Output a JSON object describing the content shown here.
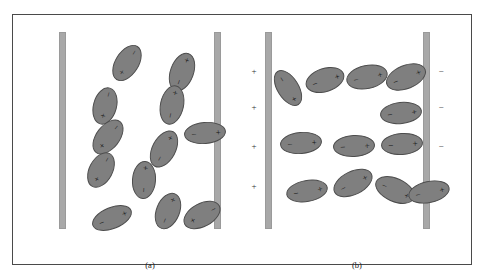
{
  "figure": {
    "background_color": "#ffffff",
    "frame_color": "#4a4a4a",
    "molecule_fill": "#7f7f7f",
    "molecule_stroke": "#4d4d4d",
    "plate_color": "#a8a8a8",
    "positive_symbol": "+",
    "negative_symbol": "−"
  },
  "panels": [
    {
      "id": "a",
      "caption": "(a)",
      "caption_x": 137,
      "caption_y": 245,
      "description": "randomly oriented polar molecules, no applied field",
      "plates": [
        {
          "name": "left-plate",
          "x": 46,
          "y": 17,
          "w": 7,
          "h": 197,
          "charge": ""
        },
        {
          "name": "right-plate",
          "x": 201,
          "y": 17,
          "w": 7,
          "h": 197,
          "charge": ""
        }
      ],
      "rail_signs": {
        "left": [],
        "right": []
      },
      "molecules": [
        {
          "cx": 114,
          "cy": 48,
          "rx": 20,
          "ry": 12,
          "rot": -58,
          "plus_at": "left",
          "minus_at": "right"
        },
        {
          "cx": 169,
          "cy": 57,
          "rx": 20,
          "ry": 12,
          "rot": -70,
          "plus_at": "right",
          "minus_at": "left"
        },
        {
          "cx": 92,
          "cy": 91,
          "rx": 19,
          "ry": 12,
          "rot": -75,
          "plus_at": "left",
          "minus_at": "right"
        },
        {
          "cx": 159,
          "cy": 90,
          "rx": 20,
          "ry": 12,
          "rot": -78,
          "plus_at": "right",
          "minus_at": "left"
        },
        {
          "cx": 95,
          "cy": 122,
          "rx": 20,
          "ry": 12,
          "rot": -52,
          "plus_at": "left",
          "minus_at": "right"
        },
        {
          "cx": 192,
          "cy": 118,
          "rx": 21,
          "ry": 11,
          "rot": -5,
          "plus_at": "right",
          "minus_at": "left"
        },
        {
          "cx": 151,
          "cy": 134,
          "rx": 20,
          "ry": 12,
          "rot": -62,
          "plus_at": "right",
          "minus_at": "left"
        },
        {
          "cx": 88,
          "cy": 155,
          "rx": 19,
          "ry": 12,
          "rot": -62,
          "plus_at": "left",
          "minus_at": "right"
        },
        {
          "cx": 131,
          "cy": 165,
          "rx": 19,
          "ry": 12,
          "rot": -86,
          "plus_at": "right",
          "minus_at": "left"
        },
        {
          "cx": 99,
          "cy": 203,
          "rx": 21,
          "ry": 11,
          "rot": -22,
          "plus_at": "right",
          "minus_at": "left"
        },
        {
          "cx": 155,
          "cy": 196,
          "rx": 19,
          "ry": 12,
          "rot": -68,
          "plus_at": "right",
          "minus_at": "left"
        },
        {
          "cx": 189,
          "cy": 200,
          "rx": 20,
          "ry": 12,
          "rot": -28,
          "plus_at": "left",
          "minus_at": "right"
        }
      ]
    },
    {
      "id": "b",
      "caption": "(b)",
      "caption_x": 114,
      "caption_y": 245,
      "description": "polar molecules aligned by the applied electric field",
      "plates": [
        {
          "name": "left-plate",
          "x": 22,
          "y": 17,
          "w": 7,
          "h": 197,
          "charge": "+"
        },
        {
          "name": "right-plate",
          "x": 180,
          "y": 17,
          "w": 7,
          "h": 197,
          "charge": "−"
        }
      ],
      "rail_signs": {
        "left": [
          {
            "sign": "+",
            "x": 11,
            "y": 56
          },
          {
            "sign": "+",
            "x": 11,
            "y": 92
          },
          {
            "sign": "+",
            "x": 11,
            "y": 131
          },
          {
            "sign": "+",
            "x": 11,
            "y": 171
          }
        ],
        "right": [
          {
            "sign": "−",
            "x": 198,
            "y": 56
          },
          {
            "sign": "−",
            "x": 198,
            "y": 92
          },
          {
            "sign": "−",
            "x": 198,
            "y": 131
          },
          {
            "sign": "−",
            "x": 198,
            "y": 171
          }
        ]
      },
      "molecules": [
        {
          "cx": 45,
          "cy": 73,
          "rx": 20,
          "ry": 11,
          "rot": 58,
          "plus_at": "right",
          "minus_at": "left"
        },
        {
          "cx": 82,
          "cy": 65,
          "rx": 20,
          "ry": 12,
          "rot": -18,
          "plus_at": "right",
          "minus_at": "left"
        },
        {
          "cx": 124,
          "cy": 62,
          "rx": 21,
          "ry": 12,
          "rot": -12,
          "plus_at": "right",
          "minus_at": "left"
        },
        {
          "cx": 163,
          "cy": 62,
          "rx": 21,
          "ry": 12,
          "rot": -22,
          "plus_at": "right",
          "minus_at": "left"
        },
        {
          "cx": 158,
          "cy": 98,
          "rx": 21,
          "ry": 11,
          "rot": -6,
          "plus_at": "right",
          "minus_at": "left"
        },
        {
          "cx": 58,
          "cy": 128,
          "rx": 21,
          "ry": 11,
          "rot": -5,
          "plus_at": "right",
          "minus_at": "left"
        },
        {
          "cx": 111,
          "cy": 131,
          "rx": 21,
          "ry": 11,
          "rot": -3,
          "plus_at": "right",
          "minus_at": "left"
        },
        {
          "cx": 159,
          "cy": 129,
          "rx": 21,
          "ry": 11,
          "rot": -4,
          "plus_at": "right",
          "minus_at": "left"
        },
        {
          "cx": 64,
          "cy": 176,
          "rx": 21,
          "ry": 11,
          "rot": -10,
          "plus_at": "right",
          "minus_at": "left"
        },
        {
          "cx": 110,
          "cy": 168,
          "rx": 21,
          "ry": 12,
          "rot": -26,
          "plus_at": "right",
          "minus_at": "left"
        },
        {
          "cx": 152,
          "cy": 175,
          "rx": 21,
          "ry": 12,
          "rot": 24,
          "plus_at": "right",
          "minus_at": "left"
        },
        {
          "cx": 186,
          "cy": 177,
          "rx": 21,
          "ry": 11,
          "rot": -12,
          "plus_at": "right",
          "minus_at": "left"
        }
      ]
    }
  ]
}
